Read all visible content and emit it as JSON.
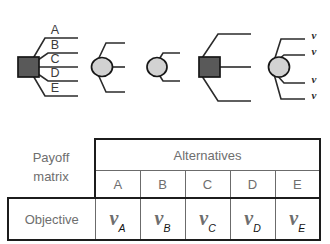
{
  "diagram": {
    "name": "decision-tree-node-series",
    "nodes": [
      {
        "id": "node-1",
        "shape": "square",
        "fill": "#595959",
        "branch_count": 5,
        "branch_labels": [
          "A",
          "B",
          "C",
          "D",
          "E"
        ]
      },
      {
        "id": "node-2",
        "shape": "circle",
        "fill": "#d2d2d2",
        "branch_count": 3,
        "branch_labels": [
          "",
          "",
          ""
        ]
      },
      {
        "id": "node-3",
        "shape": "circle",
        "fill": "#d2d2d2",
        "branch_count": 2,
        "branch_labels": [
          "",
          ""
        ]
      },
      {
        "id": "node-4",
        "shape": "square",
        "fill": "#595959",
        "branch_count": 3,
        "branch_labels": [
          "",
          "",
          ""
        ]
      },
      {
        "id": "node-5",
        "shape": "circle",
        "fill": "#d2d2d2",
        "branch_count": 4,
        "branch_labels": [
          "ν",
          "ν",
          "ν",
          "ν"
        ]
      }
    ]
  },
  "matrix": {
    "caption_line_1": "Payoff",
    "caption_line_2": "matrix",
    "group_header": "Alternatives",
    "column_headers": [
      "A",
      "B",
      "C",
      "D",
      "E"
    ],
    "row_label": "Objective",
    "values": [
      {
        "symbol": "ν",
        "subscript": "A"
      },
      {
        "symbol": "ν",
        "subscript": "B"
      },
      {
        "symbol": "ν",
        "subscript": "C"
      },
      {
        "symbol": "ν",
        "subscript": "D"
      },
      {
        "symbol": "ν",
        "subscript": "E"
      }
    ]
  },
  "colors": {
    "decision_node": "#595959",
    "chance_node": "#d2d2d2",
    "line": "#2b2b2b",
    "table_border_outer": "#1c1c1c",
    "table_border_inner": "#6b6b6b",
    "header_text": "#6e6e6e",
    "row_label_text": "#9b9b9b"
  }
}
